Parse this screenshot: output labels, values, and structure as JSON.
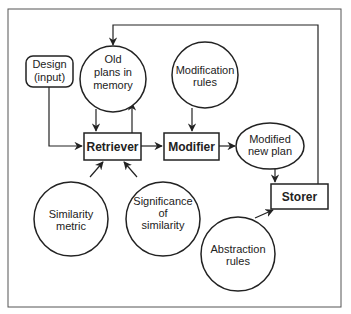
{
  "diagram": {
    "nodes": {
      "design": {
        "label_lines": [
          "Design",
          "(input)"
        ],
        "shape": "rounded-rect"
      },
      "old_plans": {
        "label_lines": [
          "Old",
          "plans in",
          "memory"
        ],
        "shape": "circle"
      },
      "modification_rules": {
        "label_lines": [
          "Modification",
          "rules"
        ],
        "shape": "circle"
      },
      "retriever": {
        "label": "Retriever",
        "shape": "rect"
      },
      "modifier": {
        "label": "Modifier",
        "shape": "rect"
      },
      "modified_new_plan": {
        "label_lines": [
          "Modified",
          "new plan"
        ],
        "shape": "ellipse"
      },
      "storer": {
        "label": "Storer",
        "shape": "rect"
      },
      "similarity_metric": {
        "label_lines": [
          "Similarity",
          "metric"
        ],
        "shape": "circle"
      },
      "significance": {
        "label_lines": [
          "Significance",
          "of",
          "similarity"
        ],
        "shape": "circle"
      },
      "abstraction_rules": {
        "label_lines": [
          "Abstraction",
          "rules"
        ],
        "shape": "circle"
      }
    },
    "edges": [
      {
        "from": "design",
        "to": "retriever"
      },
      {
        "from": "old_plans",
        "to": "retriever"
      },
      {
        "from": "retriever",
        "to": "old_plans"
      },
      {
        "from": "retriever",
        "to": "modifier"
      },
      {
        "from": "modification_rules",
        "to": "modifier"
      },
      {
        "from": "modifier",
        "to": "modified_new_plan"
      },
      {
        "from": "modified_new_plan",
        "to": "storer"
      },
      {
        "from": "similarity_metric",
        "to": "retriever"
      },
      {
        "from": "significance",
        "to": "retriever"
      },
      {
        "from": "abstraction_rules",
        "to": "storer"
      },
      {
        "from": "storer",
        "to": "old_plans"
      }
    ]
  }
}
